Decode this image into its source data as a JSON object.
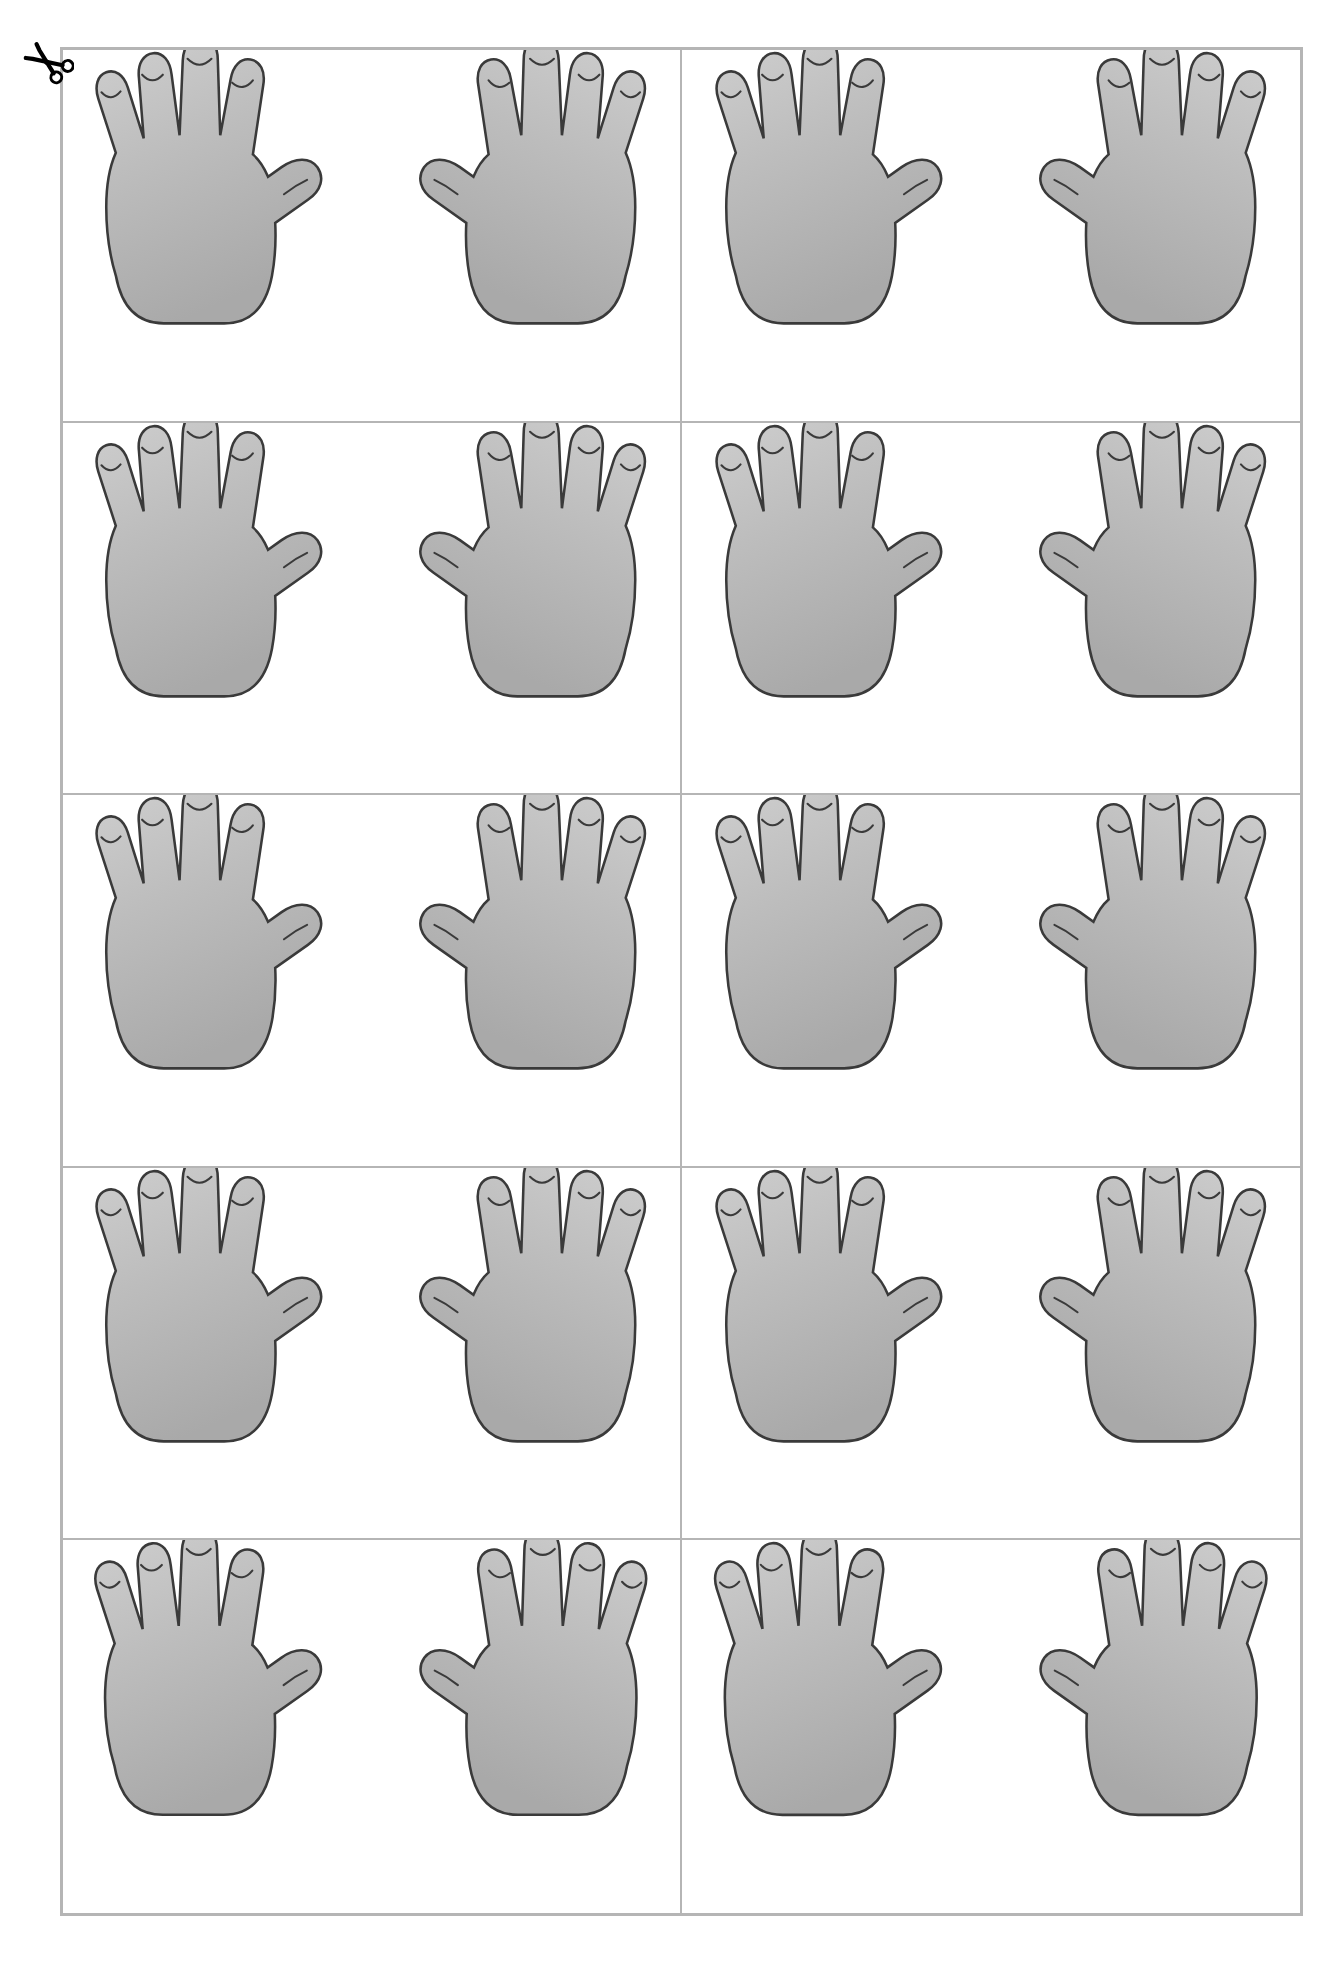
{
  "document": {
    "title": "Hands Cut-Out Template",
    "type": "printable-template",
    "background_color": "#ffffff"
  },
  "cut_marker": {
    "icon": "scissors-icon",
    "label": "cut along the line",
    "color": "#000000",
    "position": "top-left"
  },
  "grid": {
    "columns": 2,
    "rows": 5,
    "total_cells": 10,
    "border_color": "#b5b5b5",
    "divider_color": "#b5b5b5",
    "cell_background": "#ffffff"
  },
  "hand": {
    "fill_color": "#b3b3b3",
    "fill_color_light": "#c9c9c9",
    "outline_color": "#3a3a3a",
    "fingers_per_hand": 5,
    "nail_marks_per_hand": 5,
    "orientation_note": "palms facing viewer, thumbs pointing inward toward each other"
  },
  "cells": [
    {
      "index": 1,
      "row": 1,
      "col": 1,
      "name": "hand-pair-cell-1",
      "left_hand": "left-hand",
      "right_hand": "right-hand"
    },
    {
      "index": 2,
      "row": 1,
      "col": 2,
      "name": "hand-pair-cell-2",
      "left_hand": "left-hand",
      "right_hand": "right-hand"
    },
    {
      "index": 3,
      "row": 2,
      "col": 1,
      "name": "hand-pair-cell-3",
      "left_hand": "left-hand",
      "right_hand": "right-hand"
    },
    {
      "index": 4,
      "row": 2,
      "col": 2,
      "name": "hand-pair-cell-4",
      "left_hand": "left-hand",
      "right_hand": "right-hand"
    },
    {
      "index": 5,
      "row": 3,
      "col": 1,
      "name": "hand-pair-cell-5",
      "left_hand": "left-hand",
      "right_hand": "right-hand"
    },
    {
      "index": 6,
      "row": 3,
      "col": 2,
      "name": "hand-pair-cell-6",
      "left_hand": "left-hand",
      "right_hand": "right-hand"
    },
    {
      "index": 7,
      "row": 4,
      "col": 1,
      "name": "hand-pair-cell-7",
      "left_hand": "left-hand",
      "right_hand": "right-hand"
    },
    {
      "index": 8,
      "row": 4,
      "col": 2,
      "name": "hand-pair-cell-8",
      "left_hand": "left-hand",
      "right_hand": "right-hand"
    },
    {
      "index": 9,
      "row": 5,
      "col": 1,
      "name": "hand-pair-cell-9",
      "left_hand": "left-hand",
      "right_hand": "right-hand"
    },
    {
      "index": 10,
      "row": 5,
      "col": 2,
      "name": "hand-pair-cell-10",
      "left_hand": "left-hand",
      "right_hand": "right-hand"
    }
  ]
}
